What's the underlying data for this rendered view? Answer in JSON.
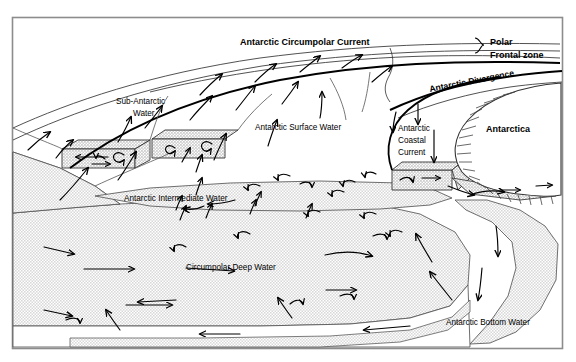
{
  "figure": {
    "frame_color": "#8c8c8c",
    "water_fill_color": "#e8e8e8",
    "line_color": "#333333",
    "arrow_color": "#000000",
    "background": "#ffffff"
  },
  "labels": {
    "antarctic_circumpolar_current": "Antarctic Circumpolar Current",
    "polar": "Polar",
    "frontal_zone": "Frontal zone",
    "antarctic_divergence": "Antarctic Divergence",
    "sub_antarctic_water_line1": "Sub-Antarctic",
    "sub_antarctic_water_line2": "Water",
    "antarctic_surface_water": "Antarctic Surface Water",
    "antarctic_coastal_current_line1": "Antarctic",
    "antarctic_coastal_current_line2": "Coastal",
    "antarctic_coastal_current_line3": "Current",
    "antarctica": "Antarctica",
    "antarctic_intermediate_water": "Antarctic Intermediate Water",
    "circumpolar_deep_water": "Circumpolar Deep Water",
    "antarctic_bottom_water": "Antarctic Bottom Water"
  },
  "water_masses": [
    {
      "name": "Sub-Antarctic Water",
      "shaded": false
    },
    {
      "name": "Antarctic Surface Water",
      "shaded": false
    },
    {
      "name": "Antarctic Intermediate Water",
      "shaded": true
    },
    {
      "name": "Circumpolar Deep Water",
      "shaded": true
    },
    {
      "name": "Antarctic Bottom Water",
      "shaded": true
    }
  ],
  "fronts": [
    {
      "name": "Antarctic Circumpolar Current",
      "style": "bold-label"
    },
    {
      "name": "Polar Frontal zone",
      "style": "brace-label"
    },
    {
      "name": "Antarctic Divergence",
      "style": "bold-curved-label"
    }
  ],
  "landmass": {
    "name": "Antarctica",
    "hatched_margin": true
  }
}
